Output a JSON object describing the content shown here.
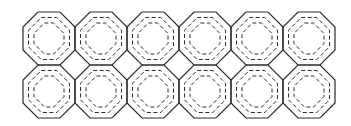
{
  "diagram": {
    "rows": 2,
    "columns": 6,
    "cell": {
      "origin_x": 23,
      "origin_y": 12,
      "width": 52,
      "height": 53,
      "chamfer": 15
    },
    "insets": [
      5.5,
      11
    ],
    "colors": {
      "background": "#ffffff",
      "stroke": "#2a2a2a"
    },
    "tiles": [
      {
        "row": 0,
        "col": 0
      },
      {
        "row": 0,
        "col": 1
      },
      {
        "row": 0,
        "col": 2
      },
      {
        "row": 0,
        "col": 3
      },
      {
        "row": 0,
        "col": 4
      },
      {
        "row": 0,
        "col": 5
      },
      {
        "row": 1,
        "col": 0
      },
      {
        "row": 1,
        "col": 1
      },
      {
        "row": 1,
        "col": 2
      },
      {
        "row": 1,
        "col": 3
      },
      {
        "row": 1,
        "col": 4
      },
      {
        "row": 1,
        "col": 5
      }
    ]
  }
}
